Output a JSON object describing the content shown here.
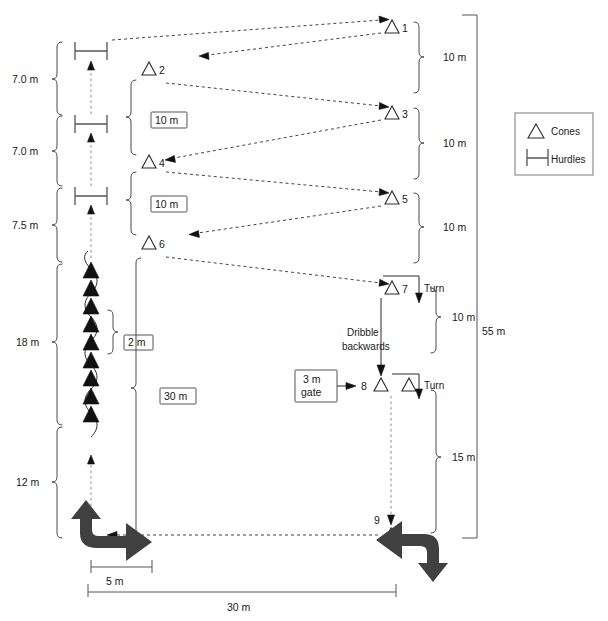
{
  "figure": {
    "title": "",
    "legend": {
      "cones_label": "Cones",
      "hurdles_label": "Hurdles"
    },
    "cone_numbers": [
      "1",
      "2",
      "3",
      "4",
      "5",
      "6",
      "7",
      "8",
      "9"
    ],
    "left_dimensions": [
      {
        "label": "7.0 m"
      },
      {
        "label": "7.0 m"
      },
      {
        "label": "7.5 m"
      },
      {
        "label": "18 m"
      },
      {
        "label": "12 m"
      }
    ],
    "right_dimensions": [
      {
        "label": "10 m"
      },
      {
        "label": "10 m"
      },
      {
        "label": "10 m"
      },
      {
        "label": "10 m"
      },
      {
        "label": "15 m"
      }
    ],
    "overall_height": "55 m",
    "boxed_labels": {
      "gap_1": "10 m",
      "gap_2": "10 m",
      "slalom_spacing": "2 m",
      "lane_length": "30 m",
      "gate": "3 m\ngate",
      "gate_line1": "3 m",
      "gate_line2": "gate"
    },
    "turn_labels": [
      "Turn",
      "Turn"
    ],
    "dribble_label_line1": "Dribble",
    "dribble_label_line2": "backwards",
    "bottom_dimensions": {
      "short": "5 m",
      "long": "30 m"
    },
    "colors": {
      "stroke": "#2a2a2a",
      "dash": "#444444",
      "arrow_fill": "#404040",
      "box_stroke": "#555555"
    }
  }
}
